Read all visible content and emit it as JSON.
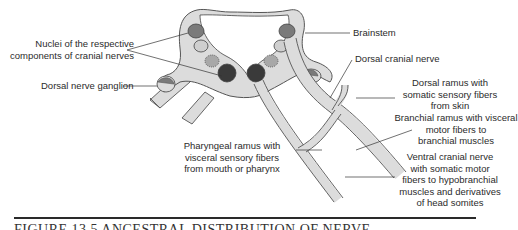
{
  "figure": {
    "labels": {
      "nuclei": [
        "Nuclei of the respective",
        "components of cranial nerves"
      ],
      "dorsal_ganglion": "Dorsal nerve ganglion",
      "brainstem": "Brainstem",
      "dorsal_cranial_nerve": "Dorsal cranial nerve",
      "dorsal_ramus": [
        "Dorsal ramus with",
        "somatic sensory fibers",
        "from skin"
      ],
      "branchial_ramus": [
        "Branchial ramus with visceral",
        "motor fibers to",
        "branchial muscles"
      ],
      "pharyngeal_ramus": [
        "Pharyngeal ramus with",
        "visceral sensory fibers",
        "from mouth or pharynx"
      ],
      "ventral_cranial_nerve": [
        "Ventral cranial nerve",
        "with somatic motor",
        "fibers to hypobranchial",
        "muscles and derivatives",
        "of head somites"
      ]
    },
    "caption": "FIGURE 13.5  ANCESTRAL DISTRIBUTION OF NERVE",
    "colors": {
      "tissue": "#dcdcdc",
      "outline": "#555555",
      "nucleus_dark": "#3a3a3a",
      "nucleus_mid": "#7a7a7a",
      "nucleus_light": "#c8c8c8",
      "nucleus_speckled": "#a8a8a8"
    }
  }
}
